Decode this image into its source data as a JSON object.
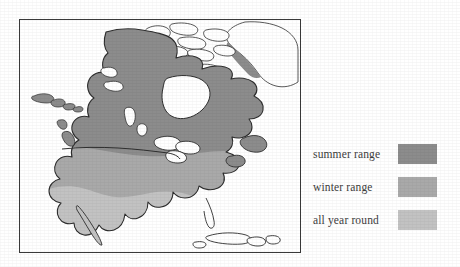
{
  "figure": {
    "type": "range-map",
    "region": "North America",
    "background_color": "#ffffff",
    "frame": {
      "border_color": "#3a3a3a",
      "fill_color": "#ffffff"
    }
  },
  "map": {
    "land_outline_color": "#2e2e2e",
    "unshaded_land_color": "#ffffff",
    "border_line_label": "us-canada-border",
    "shading_levels": [
      {
        "key": "summer",
        "color": "#8c8c8c"
      },
      {
        "key": "winter",
        "color": "#a9a9a9"
      },
      {
        "key": "allyear",
        "color": "#c2c2c2"
      }
    ]
  },
  "legend": {
    "items": [
      {
        "label": "summer range",
        "color": "#8c8c8c"
      },
      {
        "label": "winter range",
        "color": "#a9a9a9"
      },
      {
        "label": "all year round",
        "color": "#c2c2c2"
      }
    ]
  }
}
